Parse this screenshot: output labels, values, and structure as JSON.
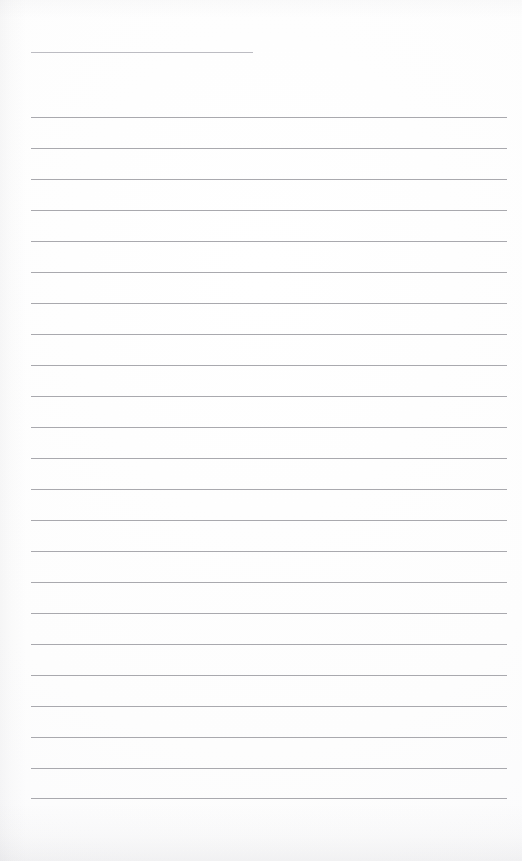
{
  "document": {
    "kind": "scanned-ruled-paper",
    "title_line_text": "",
    "body_text": "",
    "page_width": 522,
    "page_height": 861
  },
  "colors": {
    "page_background": "#fdfdfd",
    "rule_line": "#a9a9ae",
    "title_rule_line": "#bcbcc2",
    "ink": "#2b2b2f"
  },
  "title_rule": {
    "label": "title-rule",
    "y": 52,
    "x_start": 31,
    "x_end": 253,
    "thickness": 1,
    "text": ""
  },
  "ruled_lines": {
    "count": 23,
    "x_start": 31,
    "x_end": 507,
    "thickness": 1,
    "spacing": 31,
    "first_y": 117,
    "last_y": 798,
    "items": [
      {
        "index": 1,
        "y": 117,
        "text": ""
      },
      {
        "index": 2,
        "y": 148,
        "text": ""
      },
      {
        "index": 3,
        "y": 179,
        "text": ""
      },
      {
        "index": 4,
        "y": 210,
        "text": ""
      },
      {
        "index": 5,
        "y": 241,
        "text": ""
      },
      {
        "index": 6,
        "y": 272,
        "text": ""
      },
      {
        "index": 7,
        "y": 303,
        "text": ""
      },
      {
        "index": 8,
        "y": 334,
        "text": ""
      },
      {
        "index": 9,
        "y": 365,
        "text": ""
      },
      {
        "index": 10,
        "y": 396,
        "text": ""
      },
      {
        "index": 11,
        "y": 427,
        "text": ""
      },
      {
        "index": 12,
        "y": 458,
        "text": ""
      },
      {
        "index": 13,
        "y": 489,
        "text": ""
      },
      {
        "index": 14,
        "y": 520,
        "text": ""
      },
      {
        "index": 15,
        "y": 551,
        "text": ""
      },
      {
        "index": 16,
        "y": 582,
        "text": ""
      },
      {
        "index": 17,
        "y": 613,
        "text": ""
      },
      {
        "index": 18,
        "y": 644,
        "text": ""
      },
      {
        "index": 19,
        "y": 675,
        "text": ""
      },
      {
        "index": 20,
        "y": 706,
        "text": ""
      },
      {
        "index": 21,
        "y": 737,
        "text": ""
      },
      {
        "index": 22,
        "y": 768,
        "text": ""
      },
      {
        "index": 23,
        "y": 798,
        "text": ""
      }
    ]
  }
}
